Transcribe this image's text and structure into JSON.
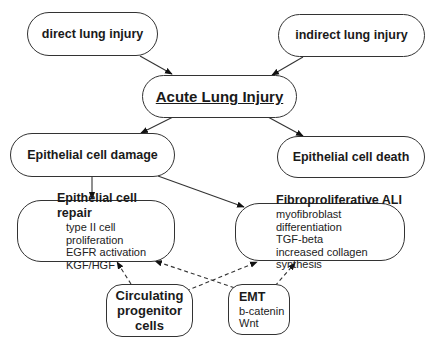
{
  "diagram": {
    "nodes": {
      "direct": {
        "title": "direct lung injury"
      },
      "indirect": {
        "title": "indirect lung injury"
      },
      "ali": {
        "title": "Acute Lung Injury"
      },
      "damage": {
        "title": "Epithelial cell damage"
      },
      "death": {
        "title": "Epithelial cell death"
      },
      "repair": {
        "title": "Epithelial cell repair",
        "items": [
          "type II cell proliferation",
          "EGFR activation",
          "KGF/HGF"
        ]
      },
      "fibro": {
        "title": "Fibroproliferative ALI",
        "items": [
          "myofibroblast differentiation",
          "TGF-beta",
          "increased collagen synthesis"
        ]
      },
      "progenitor": {
        "title_lines": [
          "Circulating",
          "progenitor",
          "cells"
        ]
      },
      "emt": {
        "title": "EMT",
        "items": [
          "b-catenin",
          "Wnt"
        ]
      }
    },
    "edges": [
      {
        "from": "direct lung injury",
        "to": "Acute Lung Injury",
        "style": "solid"
      },
      {
        "from": "indirect lung injury",
        "to": "Acute Lung Injury",
        "style": "solid"
      },
      {
        "from": "Acute Lung Injury",
        "to": "Epithelial cell damage",
        "style": "solid"
      },
      {
        "from": "Acute Lung Injury",
        "to": "Epithelial cell death",
        "style": "solid"
      },
      {
        "from": "Epithelial cell damage",
        "to": "Epithelial cell repair",
        "style": "solid"
      },
      {
        "from": "Epithelial cell damage",
        "to": "Fibroproliferative ALI",
        "style": "solid"
      },
      {
        "from": "Circulating progenitor cells",
        "to": "Epithelial cell repair",
        "style": "dashed"
      },
      {
        "from": "Circulating progenitor cells",
        "to": "Fibroproliferative ALI",
        "style": "dashed"
      },
      {
        "from": "EMT",
        "to": "Epithelial cell repair",
        "style": "dashed"
      },
      {
        "from": "EMT",
        "to": "Fibroproliferative ALI",
        "style": "dashed"
      }
    ]
  }
}
